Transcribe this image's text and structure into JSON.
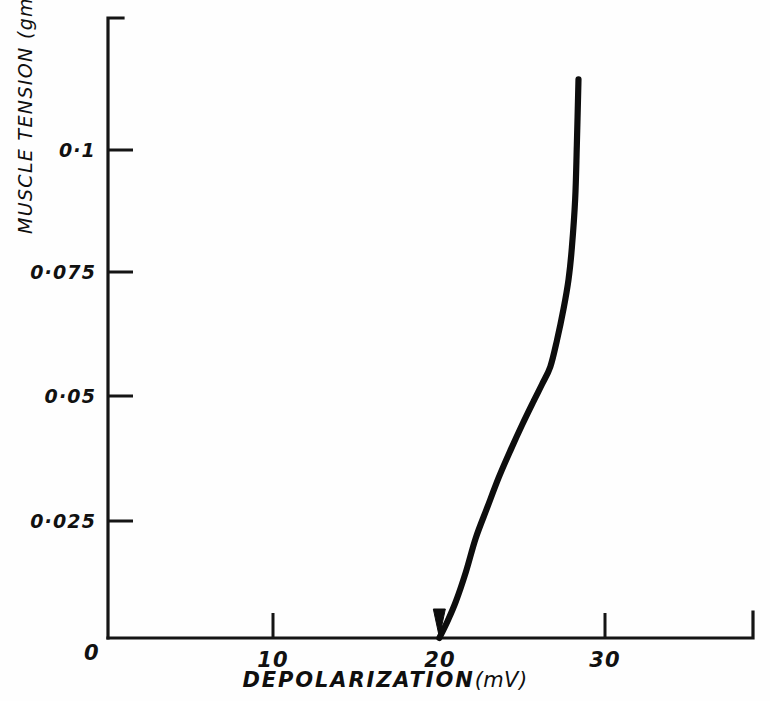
{
  "chart_data": {
    "type": "line",
    "title": "",
    "xlabel": "DEPOLARIZATION",
    "xunit": "(mV)",
    "ylabel": "MUSCLE TENSION (gm.)",
    "xlim": [
      0,
      39
    ],
    "ylim": [
      0,
      0.1265
    ],
    "grid": false,
    "legend": "none",
    "origin_label": "0",
    "xticks": [
      {
        "value": 0,
        "label": "0"
      },
      {
        "value": 10,
        "label": "10"
      },
      {
        "value": 20,
        "label": "20"
      },
      {
        "value": 30,
        "label": "30"
      }
    ],
    "yticks": [
      {
        "value": 0.025,
        "label": "0·025"
      },
      {
        "value": 0.05,
        "label": "0·05"
      },
      {
        "value": 0.075,
        "label": "0·075"
      },
      {
        "value": 0.1,
        "label": "0·1"
      }
    ],
    "series": [
      {
        "name": "tension-depolarization curve",
        "color": "#0d0d0d",
        "x": [
          20.0,
          20.5,
          21.0,
          21.6,
          22.2,
          22.9,
          23.6,
          24.3,
          25.0,
          25.7,
          26.2,
          26.7,
          27.1,
          27.5,
          27.8,
          28.0,
          28.2,
          28.3,
          28.4
        ],
        "y": [
          0.0,
          0.0035,
          0.0075,
          0.0135,
          0.0205,
          0.0268,
          0.033,
          0.0385,
          0.0437,
          0.0486,
          0.052,
          0.0556,
          0.061,
          0.0675,
          0.0735,
          0.08,
          0.09,
          0.101,
          0.1145
        ]
      }
    ],
    "annotations": [
      {
        "name": "threshold-arrow",
        "x": 20,
        "y": 0,
        "note": "downward arrowhead marking contraction threshold at 20 mV"
      }
    ]
  },
  "axes": {
    "x_title_main": "DEPOLARIZATION",
    "x_title_unit": "(mV)",
    "y_title": "MUSCLE TENSION (gm.)"
  }
}
